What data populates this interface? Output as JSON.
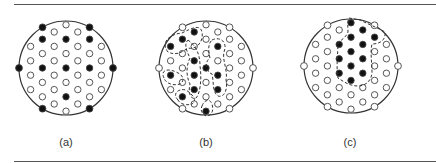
{
  "panels": [
    {
      "id": "a",
      "label": "(a)",
      "center": [
        66,
        68
      ],
      "radius": 47,
      "label_x": 66,
      "boundary_filled": true,
      "filled": [
        [
          -1,
          "A",
          1
        ],
        [
          -1,
          "A",
          3
        ],
        [
          0,
          "A",
          1
        ],
        [
          0,
          "A",
          3
        ],
        [
          0,
          "A",
          5
        ],
        [
          1,
          "A",
          1
        ],
        [
          1,
          "A",
          3
        ]
      ],
      "outlines": []
    },
    {
      "id": "b",
      "label": "(b)",
      "center": [
        206,
        68
      ],
      "radius": 47,
      "label_x": 206,
      "boundary_filled": false,
      "filled_xy": [
        [
          194,
          32
        ],
        [
          194,
          61
        ],
        [
          194,
          75
        ],
        [
          194,
          90
        ],
        [
          182,
          39
        ],
        [
          182,
          97
        ],
        [
          170,
          46
        ],
        [
          170,
          75
        ],
        [
          218,
          46
        ],
        [
          218,
          75
        ],
        [
          218,
          90
        ],
        [
          206,
          68
        ],
        [
          206,
          111
        ]
      ],
      "outlines": [
        "M168,52 C160,42 170,34 182,33 C192,28 200,24 202,32 C204,42 196,50 188,48 C182,52 176,56 168,52 Z",
        "M188,40 C196,46 200,54 200,66 C202,80 200,94 196,98 C190,100 188,92 190,84 C186,76 186,66 190,58 C186,50 184,44 188,40 Z",
        "M164,78 C160,70 168,68 176,72 C182,74 186,80 180,84 C174,86 166,84 164,78 Z",
        "M178,100 C172,94 178,88 186,90 C192,94 198,100 192,104 C186,106 180,104 178,100 Z",
        "M212,40 C220,36 228,42 224,52 C222,60 228,70 226,80 C228,90 224,98 218,96 C212,92 214,82 212,74 C206,72 204,62 210,58 C208,50 208,44 212,40 Z",
        "M202,106 C204,100 210,98 212,104 C214,110 212,116 206,116 C202,114 200,110 202,106 Z"
      ]
    },
    {
      "id": "c",
      "label": "(c)",
      "center": [
        351,
        66
      ],
      "radius": 47,
      "label_x": 350,
      "boundary_filled": false,
      "filled_xy": [
        [
          354,
          24
        ],
        [
          354,
          38
        ],
        [
          354,
          52
        ],
        [
          354,
          66
        ],
        [
          354,
          80
        ],
        [
          366,
          30
        ],
        [
          366,
          45
        ],
        [
          366,
          59
        ],
        [
          366,
          73
        ],
        [
          343,
          45
        ],
        [
          343,
          59
        ],
        [
          343,
          73
        ],
        [
          379,
          37
        ]
      ],
      "outlines": [
        "M349,18 L360,20 C368,24 378,28 385,32 C386,40 380,44 372,44 C370,52 372,62 372,72 C372,80 366,86 358,86 C350,86 344,82 338,78 C336,66 338,52 338,44 C340,40 346,38 348,32 C348,26 347,22 349,18 Z"
      ]
    }
  ],
  "grid": {
    "col_spacing": 11.8,
    "row_spacing": 14.4,
    "columns": [
      {
        "offset": -3,
        "set": "B",
        "rows": [
          1,
          2,
          3,
          4
        ]
      },
      {
        "offset": -2,
        "set": "A",
        "rows": [
          1,
          2,
          3,
          4,
          5
        ]
      },
      {
        "offset": -1,
        "set": "B",
        "rows": [
          0,
          1,
          2,
          3,
          4,
          5
        ]
      },
      {
        "offset": 0,
        "set": "A",
        "rows": [
          0,
          1,
          2,
          3,
          4,
          5,
          6
        ]
      },
      {
        "offset": 1,
        "set": "B",
        "rows": [
          0,
          1,
          2,
          3,
          4,
          5
        ]
      },
      {
        "offset": 2,
        "set": "A",
        "rows": [
          1,
          2,
          3,
          4,
          5
        ]
      },
      {
        "offset": 3,
        "set": "B",
        "rows": [
          1,
          2,
          3,
          4
        ]
      }
    ]
  },
  "colors": {
    "line": "#333333",
    "dot_fill": "#111111",
    "dot_open": "#ffffff"
  }
}
